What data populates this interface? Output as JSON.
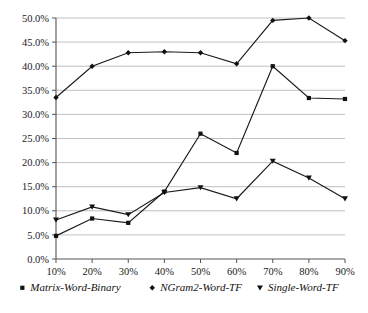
{
  "chart_data": {
    "type": "line",
    "title": "",
    "subtitle": "",
    "xlabel": "",
    "ylabel": "",
    "grid": true,
    "legend_position": "bottom",
    "categories": [
      "10%",
      "20%",
      "30%",
      "40%",
      "50%",
      "60%",
      "70%",
      "80%",
      "90%"
    ],
    "x_tick_labels": [
      "10%",
      "20%",
      "30%",
      "40%",
      "50%",
      "60%",
      "70%",
      "80%",
      "90%"
    ],
    "y_tick_labels": [
      "0.0%",
      "5.0%",
      "10.0%",
      "15.0%",
      "20.0%",
      "25.0%",
      "30.0%",
      "35.0%",
      "40.0%",
      "45.0%",
      "50.0%"
    ],
    "y_tick_values": [
      0,
      5,
      10,
      15,
      20,
      25,
      30,
      35,
      40,
      45,
      50
    ],
    "ylim": [
      0,
      50
    ],
    "series": [
      {
        "name": "Matrix-Word-Binary",
        "marker": "square",
        "color": "#111111",
        "values": [
          4.8,
          8.4,
          7.5,
          14.0,
          26.0,
          22.0,
          40.0,
          33.4,
          33.2
        ]
      },
      {
        "name": "NGram2-Word-TF",
        "marker": "diamond",
        "color": "#111111",
        "values": [
          33.5,
          40.0,
          42.8,
          43.0,
          42.8,
          40.5,
          49.5,
          50.0,
          45.3
        ]
      },
      {
        "name": "Single-Word-TF",
        "marker": "triangle",
        "color": "#111111",
        "values": [
          8.1,
          10.8,
          9.2,
          13.8,
          14.8,
          12.5,
          20.3,
          16.8,
          12.5
        ]
      }
    ]
  },
  "legend": {
    "items": [
      {
        "label": "Matrix-Word-Binary",
        "marker": "square-marker-icon"
      },
      {
        "label": "NGram2-Word-TF",
        "marker": "diamond-marker-icon"
      },
      {
        "label": "Single-Word-TF",
        "marker": "triangle-marker-icon"
      }
    ]
  },
  "colors": {
    "ink": "#111111",
    "grid": "#b9b9b9",
    "axis": "#555555",
    "background": "#ffffff"
  }
}
